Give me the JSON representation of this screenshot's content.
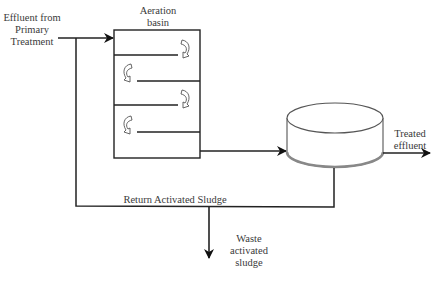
{
  "diagram": {
    "nodes": [
      {
        "id": "aeration",
        "label_line1": "Aeration",
        "label_line2": "basin"
      },
      {
        "id": "clarifier",
        "label": ""
      }
    ],
    "labels": {
      "influent": {
        "line1": "Effluent from",
        "line2": "Primary",
        "line3": "Treatment"
      },
      "aeration": {
        "line1": "Aeration",
        "line2": "basin"
      },
      "treated": {
        "line1": "Treated",
        "line2": "effluent"
      },
      "ras": {
        "text": "Return Activated Sludge"
      },
      "was": {
        "line1": "Waste",
        "line2": "activated",
        "line3": "sludge"
      }
    },
    "edges": [
      {
        "from": "influent",
        "to": "aeration"
      },
      {
        "from": "aeration",
        "to": "clarifier"
      },
      {
        "from": "clarifier",
        "to": "treated effluent"
      },
      {
        "from": "clarifier",
        "to": "aeration",
        "label": "Return Activated Sludge"
      },
      {
        "from": "return line",
        "to": "waste activated sludge"
      }
    ],
    "colors": {
      "line": "#222222",
      "fill": "#ffffff",
      "shade": "#9a9a9a"
    }
  }
}
